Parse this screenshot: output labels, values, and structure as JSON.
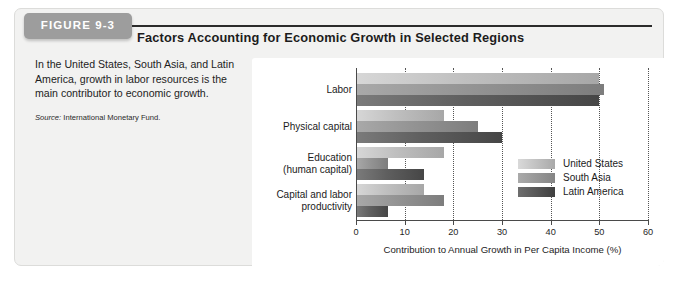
{
  "figure": {
    "tab_label": "FIGURE 9-3",
    "title": "Factors Accounting for Economic Growth in Selected Regions",
    "caption": "In the United States, South Asia, and Latin America, growth in labor resources is the main contributor to economic growth.",
    "source_prefix": "Source:",
    "source_value": "International Monetary Fund."
  },
  "colors": {
    "tab_background": "#9d9d9d",
    "tab_text": "#ffffff",
    "panel_background": "#f2f2f1",
    "chart_background": "#ffffff",
    "series_united_states": "#bfbfbf",
    "series_south_asia": "#949494",
    "series_latin_america": "#5f5f5f",
    "axis": "#4a4a4a"
  },
  "chart_data": {
    "type": "bar",
    "orientation": "horizontal",
    "title": "Factors Accounting for Economic Growth in Selected Regions",
    "xlabel": "Contribution to Annual Growth in Per Capita Income (%)",
    "ylabel": "",
    "xlim": [
      0,
      60
    ],
    "xticks": [
      0,
      10,
      20,
      30,
      40,
      50,
      60
    ],
    "xtick_labels": [
      "0",
      "10",
      "20",
      "30",
      "40",
      "50",
      "60"
    ],
    "grid": "vertical-dotted",
    "legend_position": "inside-right-lower",
    "categories": [
      "Labor",
      "Physical capital",
      "Education (human capital)",
      "Capital and labor productivity"
    ],
    "category_label_lines": [
      [
        "Labor"
      ],
      [
        "Physical capital"
      ],
      [
        "Education",
        "(human capital)"
      ],
      [
        "Capital and labor",
        "productivity"
      ]
    ],
    "series": [
      {
        "name": "United States",
        "key": "us",
        "values": [
          50,
          18,
          18,
          14
        ]
      },
      {
        "name": "South Asia",
        "key": "sa",
        "values": [
          51,
          25,
          6.5,
          18
        ]
      },
      {
        "name": "Latin America",
        "key": "la",
        "values": [
          50,
          30,
          14,
          6.5
        ]
      }
    ]
  }
}
